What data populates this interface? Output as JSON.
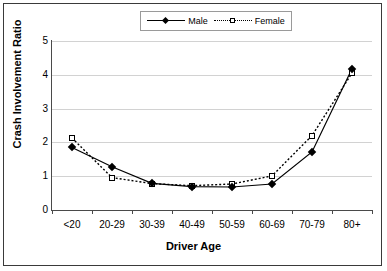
{
  "legend": {
    "position": "top-center",
    "entries": [
      {
        "label": "Male",
        "marker": "filled-diamond",
        "line": "solid"
      },
      {
        "label": "Female",
        "marker": "open-square",
        "line": "dotted"
      }
    ]
  },
  "chart_data": {
    "type": "line",
    "title": "",
    "xlabel": "Driver Age",
    "ylabel": "Crash Involvement Ratio",
    "categories": [
      "<20",
      "20-29",
      "30-39",
      "40-49",
      "50-59",
      "60-69",
      "70-79",
      "80+"
    ],
    "series": [
      {
        "name": "Male",
        "values": [
          1.85,
          1.28,
          0.79,
          0.69,
          0.68,
          0.77,
          1.72,
          4.18
        ]
      },
      {
        "name": "Female",
        "values": [
          2.13,
          0.96,
          0.78,
          0.72,
          0.77,
          1.01,
          2.2,
          4.05
        ]
      }
    ],
    "ylim": [
      0,
      5
    ],
    "yticks": [
      0,
      1,
      2,
      3,
      4,
      5
    ],
    "ytick_labels": [
      "0",
      "1",
      "2",
      "3",
      "4",
      "5"
    ],
    "grid": true,
    "grid_axis": "y"
  },
  "colors": {
    "line": "#000000",
    "grid": "#d2d2d2",
    "axis": "#4a4a4a",
    "background": "#ffffff",
    "border": "#3a3a3a"
  }
}
